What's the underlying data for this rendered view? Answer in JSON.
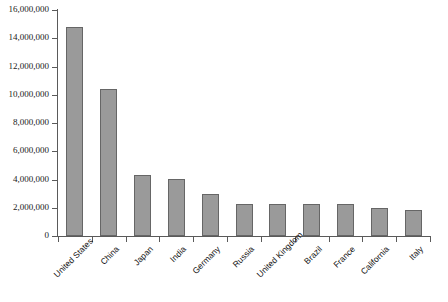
{
  "chart_data": {
    "type": "bar",
    "title": "",
    "subtitle": "",
    "xlabel": "",
    "ylabel": "",
    "ylim": [
      0,
      16000000
    ],
    "ytick_step": 2000000,
    "grid": false,
    "legend": false,
    "legend_position": "none",
    "orientation": "vertical",
    "bar_color": "#9a9a9a",
    "bar_edge_color": "#666666",
    "axis_color": "#5a5a5a",
    "categories": [
      "United States",
      "China",
      "Japan",
      "India",
      "Germany",
      "Russia",
      "United Kingdom",
      "Brazil",
      "France",
      "California",
      "Italy"
    ],
    "values": [
      14800000,
      10400000,
      4300000,
      4050000,
      3000000,
      2300000,
      2300000,
      2300000,
      2250000,
      2000000,
      1850000
    ],
    "ytick_labels": [
      "0",
      "2,000,000",
      "4,000,000",
      "6,000,000",
      "8,000,000",
      "10,000,000",
      "12,000,000",
      "14,000,000",
      "16,000,000"
    ],
    "ytick_values": [
      0,
      2000000,
      4000000,
      6000000,
      8000000,
      10000000,
      12000000,
      14000000,
      16000000
    ]
  }
}
